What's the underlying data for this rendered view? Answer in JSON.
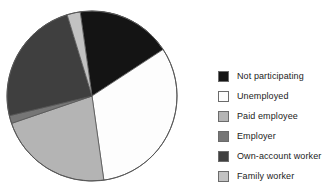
{
  "chart_data": {
    "type": "pie",
    "title": "",
    "xlabel": "",
    "ylabel": "",
    "legend_position": "right",
    "grid": false,
    "start_angle_deg": -8,
    "direction": "clockwise",
    "categories": [
      "Not participating",
      "Unemployed",
      "Paid employee",
      "Employer",
      "Own-account worker",
      "Family worker"
    ],
    "values": [
      18,
      32,
      22,
      1.5,
      24,
      2.5
    ],
    "units": "percent",
    "colors": [
      "#141414",
      "#fdfdfd",
      "#b4b4b4",
      "#767676",
      "#3f3f3f",
      "#c2c2c2"
    ],
    "slices": [
      {
        "label": "Not participating",
        "value": 18,
        "color": "#141414",
        "start_deg": -8,
        "end_deg": 56.8
      },
      {
        "label": "Unemployed",
        "value": 32,
        "color": "#fdfdfd",
        "start_deg": 56.8,
        "end_deg": 172
      },
      {
        "label": "Paid employee",
        "value": 22,
        "color": "#b4b4b4",
        "start_deg": 172,
        "end_deg": 251.2
      },
      {
        "label": "Employer",
        "value": 1.5,
        "color": "#767676",
        "start_deg": 251.2,
        "end_deg": 256.6
      },
      {
        "label": "Own-account worker",
        "value": 24,
        "color": "#3f3f3f",
        "start_deg": 256.6,
        "end_deg": 343
      },
      {
        "label": "Family worker",
        "value": 2.5,
        "color": "#c2c2c2",
        "start_deg": 343,
        "end_deg": 352
      }
    ],
    "geometry": {
      "cx": 92,
      "cy": 96,
      "r": 85,
      "stroke": "#555555"
    }
  },
  "legend": {
    "items": [
      {
        "label": "Not participating",
        "color": "#141414"
      },
      {
        "label": "Unemployed",
        "color": "#fdfdfd"
      },
      {
        "label": "Paid employee",
        "color": "#b4b4b4"
      },
      {
        "label": "Employer",
        "color": "#767676"
      },
      {
        "label": "Own-account worker",
        "color": "#3f3f3f"
      },
      {
        "label": "Family worker",
        "color": "#c2c2c2"
      }
    ]
  }
}
